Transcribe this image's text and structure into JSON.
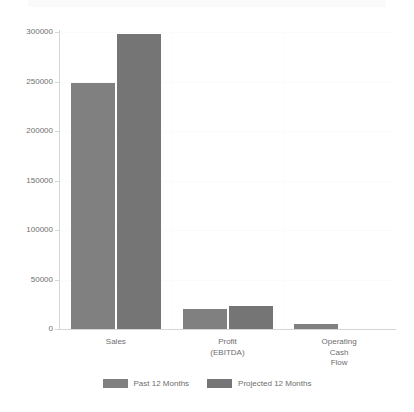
{
  "chart_data": {
    "type": "bar",
    "title": "",
    "xlabel": "",
    "ylabel": "",
    "ylim": [
      0,
      300000
    ],
    "grid": true,
    "legend_position": "bottom",
    "categories": [
      "Sales",
      "Profit (EBITDA)",
      "Operating Cash Flow"
    ],
    "category_label_lines": [
      [
        "Sales"
      ],
      [
        "Profit",
        "(EBITDA)"
      ],
      [
        "Operating",
        "Cash",
        "Flow"
      ]
    ],
    "yticks": [
      0,
      50000,
      100000,
      150000,
      200000,
      250000,
      300000
    ],
    "ytick_labels": [
      "0",
      "50000",
      "100000",
      "150000",
      "200000",
      "250000",
      "300000"
    ],
    "series": [
      {
        "name": "Past 12 Months",
        "color": "#808080",
        "values": [
          249000,
          20500,
          5500
        ]
      },
      {
        "name": "Projected 12 Months",
        "color": "#757575",
        "values": [
          298000,
          23500,
          0
        ]
      }
    ]
  },
  "legend": {
    "items": [
      {
        "label": "Past 12 Months",
        "color": "#808080"
      },
      {
        "label": "Projected 12 Months",
        "color": "#757575"
      }
    ]
  },
  "colors": {
    "background": "#ffffff",
    "axis": "#d6d6d6",
    "grid": "#fbfbfb",
    "text": "#6e6e6e",
    "series_past": "#808080",
    "series_projected": "#757575"
  }
}
